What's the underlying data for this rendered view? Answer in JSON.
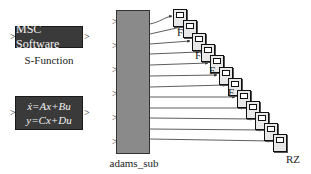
{
  "sfunction_block": {
    "label": "MSC Software",
    "caption": "S-Function",
    "input_port": ">",
    "output_port": ">"
  },
  "state_space_block": {
    "line1": "ẋ=Ax+Bu",
    "line2": "y=Cx+Du",
    "input_port": ">",
    "output_port": ">"
  },
  "adams_block": {
    "caption": "adams_sub",
    "input_ports": [
      ">",
      ">",
      ">",
      ">",
      ">",
      ">"
    ]
  },
  "scopes": {
    "count": 12,
    "labels": {
      "f1": "F",
      "f2": "F",
      "f3": "F",
      "f4": "F",
      "rz": "RZ"
    }
  },
  "colors": {
    "dark_block": "#3a3a3a",
    "subsystem": "#8a8a8a",
    "wire": "#333333"
  }
}
